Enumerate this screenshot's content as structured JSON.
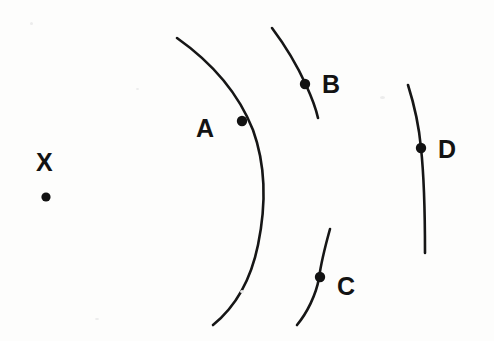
{
  "figure": {
    "type": "diagram",
    "background_color": "#fdfdfc",
    "stroke_color": "#161616",
    "label_color": "#131313",
    "width": 494,
    "height": 341,
    "source_label": {
      "text": "X",
      "x": 44,
      "y": 162,
      "dot": {
        "cx": 46,
        "cy": 197,
        "r": 4.6
      }
    },
    "wavefronts": [
      {
        "id": "A",
        "label": "A",
        "label_x": 206,
        "label_y": 128,
        "dot": {
          "cx": 242,
          "cy": 121,
          "r": 5.2
        },
        "path": "M 177 38 C 211 62 238 92 253 130 C 266 166 266 206 258 245 C 250 284 234 308 213 325",
        "stroke_width": 2.6
      },
      {
        "id": "B",
        "label": "B",
        "label_x": 332,
        "label_y": 86,
        "dot": {
          "cx": 305,
          "cy": 84,
          "r": 5.2
        },
        "path": "M 272 28 C 284 44 296 63 306 85 C 312 98 316 109 318 118",
        "stroke_width": 2.6
      },
      {
        "id": "C",
        "label": "C",
        "label_x": 344,
        "label_y": 288,
        "dot": {
          "cx": 320,
          "cy": 277,
          "r": 5.2
        },
        "path": "M 330 229 C 325 247 321 263 319 278 C 316 295 307 313 297 325",
        "stroke_width": 2.6
      },
      {
        "id": "D",
        "label": "D",
        "label_x": 442,
        "label_y": 140,
        "dot": {
          "cx": 421,
          "cy": 148,
          "r": 5.2
        },
        "path": "M 408 85 C 414 104 419 126 421 148 C 424 176 425 215 425 253",
        "stroke_width": 2.6
      }
    ]
  }
}
